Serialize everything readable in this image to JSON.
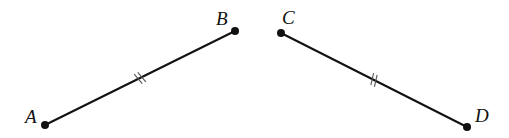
{
  "diagram": {
    "title": "",
    "points": [
      {
        "id": "A",
        "label": "A"
      },
      {
        "id": "B",
        "label": "B"
      },
      {
        "id": "C",
        "label": "C"
      },
      {
        "id": "D",
        "label": "D"
      }
    ],
    "segments": [
      {
        "id": "AB",
        "from": "A",
        "to": "B",
        "tick_marks": 2
      },
      {
        "id": "CD",
        "from": "C",
        "to": "D",
        "tick_marks": 2
      }
    ],
    "relation": "AB ≅ CD",
    "colors": {
      "line": "#111111",
      "tick": "#555555",
      "background": "#ffffff"
    }
  }
}
